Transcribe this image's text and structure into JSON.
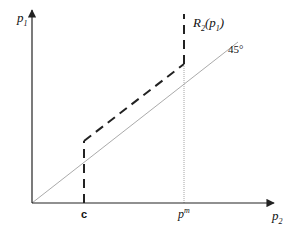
{
  "diagram": {
    "axes": {
      "y_label": {
        "base": "p",
        "sub": "1"
      },
      "x_label": {
        "base": "p",
        "sub": "2"
      }
    },
    "curve_label": {
      "base": "R",
      "sub": "2",
      "arg_base": "p",
      "arg_sub": "1"
    },
    "line_label": "45°",
    "x_ticks": {
      "c": "c",
      "pm": {
        "base": "p",
        "sup": "m"
      }
    },
    "colors": {
      "axis": "#222222",
      "curve": "#222222",
      "diagonal": "#9a9a9a",
      "guide": "#9a9a9a"
    }
  }
}
